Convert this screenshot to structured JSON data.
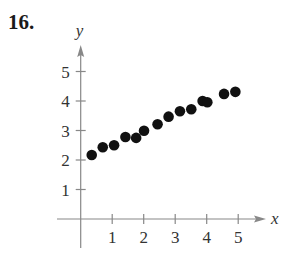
{
  "problem_number": "16.",
  "chart_data": {
    "type": "scatter",
    "title": "",
    "xlabel": "x",
    "ylabel": "y",
    "xlim": [
      0,
      5.6
    ],
    "ylim": [
      0,
      5.6
    ],
    "x_ticks": [
      1,
      2,
      3,
      4,
      5
    ],
    "y_ticks": [
      1,
      2,
      3,
      4,
      5
    ],
    "grid": false,
    "legend": null,
    "points": [
      {
        "x": 0.35,
        "y": 2.17
      },
      {
        "x": 0.7,
        "y": 2.43
      },
      {
        "x": 1.06,
        "y": 2.5
      },
      {
        "x": 1.42,
        "y": 2.78
      },
      {
        "x": 1.76,
        "y": 2.75
      },
      {
        "x": 2.01,
        "y": 2.99
      },
      {
        "x": 2.44,
        "y": 3.21
      },
      {
        "x": 2.79,
        "y": 3.47
      },
      {
        "x": 3.15,
        "y": 3.65
      },
      {
        "x": 3.51,
        "y": 3.72
      },
      {
        "x": 3.87,
        "y": 4.0
      },
      {
        "x": 4.02,
        "y": 3.96
      },
      {
        "x": 4.55,
        "y": 4.24
      },
      {
        "x": 4.91,
        "y": 4.31
      }
    ],
    "colors": {
      "points": "#111111",
      "axes": "#888888"
    }
  }
}
